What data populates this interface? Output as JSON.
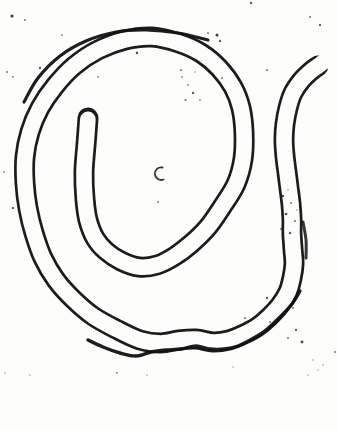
{
  "figure": {
    "type": "scanned-line-drawing",
    "canvas": {
      "width": 337,
      "height": 431
    },
    "colors": {
      "ink": "#1c1c1c",
      "paper": "#fdfdfc",
      "emphasis": "#121212"
    },
    "worm": {
      "body_stroke_width": 21,
      "lumen_stroke_width": 15.6,
      "head": {
        "style": "rounded-closed",
        "x": 88,
        "y": 118
      },
      "tail": {
        "style": "open-fading",
        "x": 318,
        "y": 66
      },
      "head_inset_t": 0.05,
      "tail_extension_px": 9,
      "centerline": [
        [
          88,
          118
        ],
        [
          86,
          145
        ],
        [
          84,
          172
        ],
        [
          85,
          199
        ],
        [
          88,
          220
        ],
        [
          95,
          238
        ],
        [
          106,
          251
        ],
        [
          121,
          261
        ],
        [
          139,
          267
        ],
        [
          157,
          265
        ],
        [
          175,
          256
        ],
        [
          192,
          243
        ],
        [
          208,
          227
        ],
        [
          222,
          207
        ],
        [
          236,
          184
        ],
        [
          243,
          159
        ],
        [
          244,
          133
        ],
        [
          241,
          108
        ],
        [
          233,
          87
        ],
        [
          219,
          68
        ],
        [
          201,
          53
        ],
        [
          179,
          43
        ],
        [
          152,
          37
        ],
        [
          125,
          40
        ],
        [
          98,
          50
        ],
        [
          74,
          66
        ],
        [
          55,
          86
        ],
        [
          40,
          108
        ],
        [
          30,
          132
        ],
        [
          25,
          157
        ],
        [
          25,
          183
        ],
        [
          28,
          208
        ],
        [
          34,
          233
        ],
        [
          43,
          258
        ],
        [
          56,
          280
        ],
        [
          73,
          299
        ],
        [
          93,
          316
        ],
        [
          116,
          329
        ],
        [
          140,
          340
        ],
        [
          161,
          343
        ],
        [
          179,
          340
        ],
        [
          196,
          339
        ],
        [
          213,
          342
        ],
        [
          229,
          340
        ],
        [
          244,
          334
        ],
        [
          257,
          327
        ],
        [
          269,
          317
        ],
        [
          280,
          305
        ],
        [
          288,
          292
        ],
        [
          292,
          278
        ],
        [
          294,
          264
        ],
        [
          293,
          249
        ],
        [
          292,
          234
        ],
        [
          292,
          219
        ],
        [
          291,
          204
        ],
        [
          289,
          188
        ],
        [
          287,
          172
        ],
        [
          285,
          156
        ],
        [
          284,
          140
        ],
        [
          285,
          124
        ],
        [
          288,
          108
        ],
        [
          293,
          93
        ],
        [
          301,
          81
        ],
        [
          310,
          72
        ],
        [
          318,
          66
        ]
      ]
    },
    "emphasis_strokes": [
      {
        "width": 3.2,
        "opacity": 0.95,
        "points": [
          [
            208,
            40
          ],
          [
            178,
            33
          ],
          [
            146,
            30
          ],
          [
            116,
            32
          ],
          [
            86,
            41
          ],
          [
            60,
            56
          ],
          [
            38,
            78
          ],
          [
            24,
            102
          ]
        ]
      },
      {
        "width": 3.4,
        "opacity": 0.95,
        "points": [
          [
            88,
            340
          ],
          [
            103,
            347
          ],
          [
            120,
            353
          ],
          [
            136,
            356
          ],
          [
            151,
            352
          ],
          [
            166,
            350
          ],
          [
            181,
            349
          ],
          [
            196,
            346
          ],
          [
            210,
            349
          ],
          [
            224,
            349
          ],
          [
            238,
            346
          ],
          [
            252,
            339
          ],
          [
            266,
            330
          ],
          [
            279,
            318
          ],
          [
            292,
            304
          ],
          [
            300,
            291
          ]
        ]
      },
      {
        "width": 3.0,
        "opacity": 0.85,
        "points": [
          [
            303,
            222
          ],
          [
            306,
            240
          ],
          [
            306,
            258
          ]
        ]
      }
    ],
    "center_mark": {
      "type": "crescent-open-right",
      "start": [
        162.5,
        167.5
      ],
      "end": [
        163.5,
        179.5
      ],
      "radius": 6.3,
      "stroke_width": 1.8
    },
    "speckles": [
      [
        12,
        16,
        1.6,
        0.85
      ],
      [
        25,
        20,
        1.0,
        0.6
      ],
      [
        62,
        35,
        1.0,
        0.5
      ],
      [
        7,
        72,
        1.0,
        0.55
      ],
      [
        13,
        77,
        1.0,
        0.5
      ],
      [
        40,
        68,
        1.2,
        0.7
      ],
      [
        98,
        77,
        1.0,
        0.5
      ],
      [
        137,
        53,
        1.2,
        0.8
      ],
      [
        181,
        70,
        1.0,
        0.6
      ],
      [
        193,
        93,
        1.2,
        0.7
      ],
      [
        186,
        100,
        0.9,
        0.5
      ],
      [
        182,
        77,
        0.9,
        0.5
      ],
      [
        195,
        72,
        0.8,
        0.5
      ],
      [
        217,
        35,
        1.5,
        0.85
      ],
      [
        220,
        41,
        1.2,
        0.7
      ],
      [
        208,
        33,
        1.0,
        0.6
      ],
      [
        222,
        78,
        1.0,
        0.6
      ],
      [
        188,
        85,
        0.9,
        0.5
      ],
      [
        200,
        100,
        0.9,
        0.5
      ],
      [
        185,
        100,
        0.8,
        0.45
      ],
      [
        251,
        3,
        1.2,
        0.7
      ],
      [
        310,
        17,
        1.0,
        0.6
      ],
      [
        320,
        25,
        1.2,
        0.7
      ],
      [
        267,
        70,
        1.0,
        0.6
      ],
      [
        4,
        172,
        0.9,
        0.5
      ],
      [
        13,
        208,
        1.2,
        0.7
      ],
      [
        158,
        202,
        1.0,
        0.55
      ],
      [
        283,
        196,
        1.2,
        0.75
      ],
      [
        291,
        203,
        1.0,
        0.6
      ],
      [
        286,
        214,
        1.3,
        0.8
      ],
      [
        295,
        221,
        1.0,
        0.65
      ],
      [
        281,
        229,
        1.0,
        0.6
      ],
      [
        290,
        233,
        1.2,
        0.75
      ],
      [
        297,
        210,
        0.8,
        0.5
      ],
      [
        288,
        190,
        0.8,
        0.5
      ],
      [
        245,
        318,
        1.0,
        0.6
      ],
      [
        267,
        298,
        1.2,
        0.7
      ],
      [
        293,
        308,
        1.0,
        0.6
      ],
      [
        270,
        322,
        1.0,
        0.6
      ],
      [
        302,
        342,
        1.4,
        0.8
      ],
      [
        296,
        330,
        1.2,
        0.7
      ],
      [
        288,
        338,
        1.0,
        0.6
      ],
      [
        308,
        375,
        0.8,
        0.45
      ],
      [
        323,
        365,
        0.8,
        0.45
      ],
      [
        335,
        352,
        1.0,
        0.55
      ],
      [
        313,
        360,
        0.8,
        0.45
      ],
      [
        318,
        370,
        0.8,
        0.4
      ],
      [
        5,
        373,
        0.8,
        0.45
      ],
      [
        30,
        375,
        0.8,
        0.45
      ],
      [
        117,
        373,
        1.0,
        0.5
      ],
      [
        147,
        375,
        0.8,
        0.45
      ],
      [
        233,
        367,
        0.8,
        0.4
      ]
    ]
  }
}
